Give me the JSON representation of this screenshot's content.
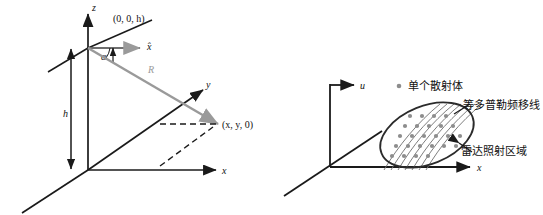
{
  "figure": {
    "kind": "two-panel-geometry-diagram",
    "background_color": "#ffffff",
    "axis_color": "#1a1a1a",
    "ray_color": "#9a9a9a",
    "ellipse_color": "#2b2b2b",
    "scatterer_color": "#8d8d8d",
    "doppler_line_color": "#6f6f6f"
  },
  "left_panel": {
    "name": "radar-platform-geometry",
    "axes": {
      "z_label": "z",
      "y_label": "y",
      "x_label": "x"
    },
    "annotations": {
      "platform_point": "(0, 0, h)",
      "xhat_label": "x̂",
      "angle_label": "α",
      "range_label": "R",
      "height_label": "h",
      "ground_point": "(x, y, 0)"
    }
  },
  "right_panel": {
    "name": "radar-footprint-doppler",
    "axes": {
      "u_label": "u",
      "x_label": "x"
    },
    "legend": {
      "marker": "scatterer-dot",
      "label": "单个散射体"
    },
    "callouts": [
      {
        "id": "iso-doppler",
        "label": "等多普勒频移线"
      },
      {
        "id": "radar-footprint",
        "label": "雷达照射区域"
      }
    ]
  }
}
